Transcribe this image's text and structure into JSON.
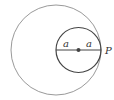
{
  "diagram": {
    "type": "tangent-circles",
    "outer_circle": {
      "cx": 56,
      "cy": 50,
      "r": 45,
      "stroke": "#9a9a9a"
    },
    "inner_circle": {
      "cx": 78.5,
      "cy": 50,
      "r": 22.5,
      "stroke": "#444444"
    },
    "diameter": {
      "x1": 56,
      "x2": 101,
      "y": 50,
      "stroke": "#444444"
    },
    "center_dot": {
      "cx": 78.5,
      "cy": 50,
      "r": 2,
      "fill": "#444444"
    },
    "labels": {
      "left_radius": "a",
      "right_radius": "a",
      "tangent_point": "P"
    }
  }
}
